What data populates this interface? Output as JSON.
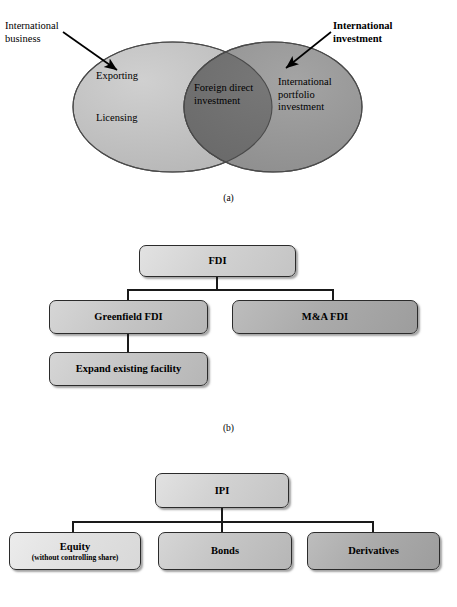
{
  "figure": {
    "panels": [
      {
        "id": "a",
        "caption": "(a)",
        "type": "venn",
        "labels": {
          "left_callout": "International\nbusiness",
          "right_callout": "International\ninvestment",
          "left_item_1": "Exporting",
          "left_item_2": "Licensing",
          "intersection": "Foreign direct\ninvestment",
          "right_item": "International\nportfolio\ninvestment"
        },
        "colors": {
          "left_ellipse": "#bdbdbd",
          "right_ellipse": "#959595",
          "intersection": "#6e6e6e",
          "stroke": "#4a4a4a"
        }
      },
      {
        "id": "b",
        "caption": "(b)",
        "type": "tree",
        "root": "FDI",
        "nodes": [
          {
            "label": "FDI",
            "tone": "light"
          },
          {
            "label": "Greenfield FDI",
            "tone": "mid"
          },
          {
            "label": "M&A FDI",
            "tone": "dark"
          },
          {
            "label": "Expand existing facility",
            "tone": "mid"
          }
        ]
      },
      {
        "id": "c",
        "type": "tree",
        "root": "IPI",
        "nodes": [
          {
            "label": "IPI",
            "tone": "light"
          },
          {
            "label": "Equity",
            "sub": "(without controlling share)",
            "tone": "xlight"
          },
          {
            "label": "Bonds",
            "tone": "mid"
          },
          {
            "label": "Derivatives",
            "tone": "dark"
          }
        ]
      }
    ]
  }
}
